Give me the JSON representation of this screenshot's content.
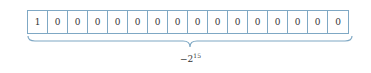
{
  "bits": [
    "1",
    "0",
    "0",
    "0",
    "0",
    "0",
    "0",
    "0",
    "0",
    "0",
    "0",
    "0",
    "0",
    "0",
    "0",
    "0"
  ],
  "label": {
    "base": "−2",
    "exponent": "15"
  },
  "colors": {
    "border": "#7fa8c4",
    "text": "#333333"
  }
}
